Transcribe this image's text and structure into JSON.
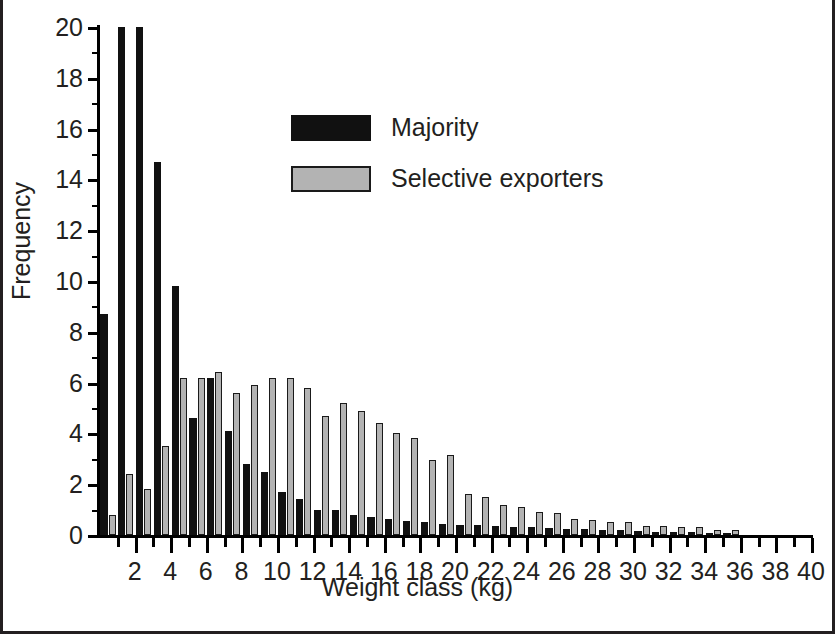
{
  "chart_data": {
    "type": "bar",
    "title": "",
    "xlabel": "Weight class (kg)",
    "ylabel": "Frequency",
    "xlim": [
      0,
      40
    ],
    "ylim": [
      0,
      20
    ],
    "ytick_step": 2,
    "yticks": [
      0,
      2,
      4,
      6,
      8,
      10,
      12,
      14,
      16,
      18,
      20
    ],
    "ytick_labels": [
      "0",
      "2",
      "4",
      "6",
      "8",
      "10",
      "12",
      "14",
      "16",
      "18",
      "20"
    ],
    "xticks": [
      1,
      2,
      3,
      4,
      5,
      6,
      7,
      8,
      9,
      10,
      11,
      12,
      13,
      14,
      15,
      16,
      17,
      18,
      19,
      20,
      21,
      22,
      23,
      24,
      25,
      26,
      27,
      28,
      29,
      30,
      31,
      32,
      33,
      34,
      35,
      36,
      37,
      38,
      39,
      40
    ],
    "xtick_labels_major": [
      "2",
      "4",
      "6",
      "8",
      "10",
      "12",
      "14",
      "16",
      "18",
      "20",
      "22",
      "24",
      "26",
      "28",
      "30",
      "32",
      "34",
      "36",
      "38",
      "40"
    ],
    "grid": false,
    "legend_position": "upper-center",
    "categories": [
      1,
      2,
      3,
      4,
      5,
      6,
      7,
      8,
      9,
      10,
      11,
      12,
      13,
      14,
      15,
      16,
      17,
      18,
      19,
      20,
      21,
      22,
      23,
      24,
      25,
      26,
      27,
      28,
      29,
      30,
      31,
      32,
      33,
      34,
      35,
      36,
      37,
      38,
      39,
      40
    ],
    "series": [
      {
        "name": "Majority",
        "color": "#111111",
        "values": [
          8.7,
          20.0,
          20.0,
          14.7,
          9.8,
          4.6,
          6.2,
          4.1,
          2.8,
          2.5,
          1.7,
          1.4,
          1.0,
          1.0,
          0.8,
          0.7,
          0.65,
          0.55,
          0.5,
          0.45,
          0.4,
          0.4,
          0.35,
          0.3,
          0.3,
          0.28,
          0.25,
          0.22,
          0.2,
          0.18,
          0.15,
          0.13,
          0.12,
          0.1,
          0.08,
          0.06,
          0,
          0,
          0,
          0
        ]
      },
      {
        "name": "Selective exporters",
        "color": "#b3b3b3",
        "values": [
          0.8,
          2.4,
          1.8,
          3.5,
          6.2,
          6.2,
          6.4,
          5.6,
          5.9,
          6.2,
          6.2,
          5.8,
          4.7,
          5.2,
          4.9,
          4.4,
          4.0,
          3.8,
          2.95,
          3.15,
          1.6,
          1.5,
          1.2,
          1.1,
          0.9,
          0.85,
          0.65,
          0.6,
          0.5,
          0.5,
          0.35,
          0.35,
          0.3,
          0.3,
          0.2,
          0.18,
          0,
          0,
          0,
          0
        ]
      }
    ]
  },
  "legend": {
    "items": [
      {
        "label": "Majority",
        "swatch": "black-swatch"
      },
      {
        "label": "Selective exporters",
        "swatch": "gray-swatch"
      }
    ]
  },
  "axes": {
    "y_title": "Frequency",
    "x_title": "Weight class (kg)"
  }
}
